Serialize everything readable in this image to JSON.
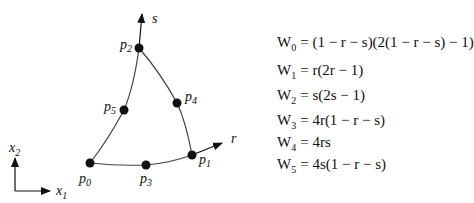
{
  "diagram": {
    "axes": {
      "x1_label": "x",
      "x1_sub": "1",
      "x2_label": "x",
      "x2_sub": "2",
      "r_label": "r",
      "s_label": "s"
    },
    "points": [
      {
        "id": "p0",
        "label": "p",
        "sub": "0",
        "x": 90,
        "y": 163
      },
      {
        "id": "p1",
        "label": "p",
        "sub": "1",
        "x": 192,
        "y": 155
      },
      {
        "id": "p2",
        "label": "p",
        "sub": "2",
        "x": 139,
        "y": 48
      },
      {
        "id": "p3",
        "label": "p",
        "sub": "3",
        "x": 146,
        "y": 165
      },
      {
        "id": "p4",
        "label": "p",
        "sub": "4",
        "x": 177,
        "y": 103
      },
      {
        "id": "p5",
        "label": "p",
        "sub": "5",
        "x": 124,
        "y": 110
      }
    ]
  },
  "equations": [
    {
      "name": "W",
      "sub": "0",
      "rhs": "= (1 − r − s)(2(1 − r − s) − 1)"
    },
    {
      "name": "W",
      "sub": "1",
      "rhs": "= r(2r − 1)"
    },
    {
      "name": "W",
      "sub": "2",
      "rhs": "= s(2s − 1)"
    },
    {
      "name": "W",
      "sub": "3",
      "rhs": "= 4r(1 − r − s)"
    },
    {
      "name": "W",
      "sub": "4",
      "rhs": "= 4rs"
    },
    {
      "name": "W",
      "sub": "5",
      "rhs": "= 4s(1 − r − s)"
    }
  ]
}
